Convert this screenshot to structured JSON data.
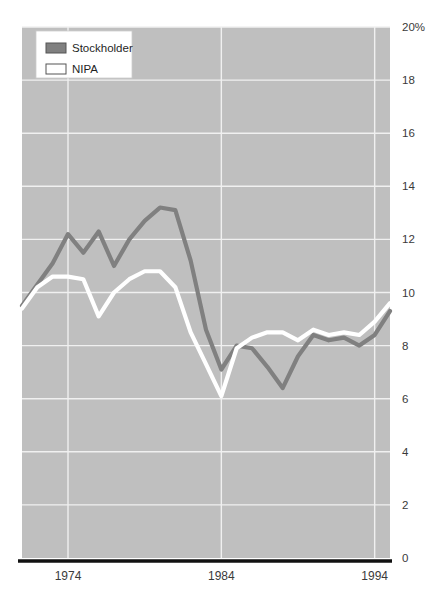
{
  "chart_data": {
    "type": "line",
    "title": "",
    "subtitle": "",
    "xlabel": "",
    "ylabel": "",
    "xlim": [
      1971,
      1995
    ],
    "ylim": [
      0,
      20
    ],
    "grid": true,
    "legend_position": "top-left",
    "y_ticks": [
      "0",
      "2",
      "4",
      "6",
      "8",
      "10",
      "12",
      "14",
      "16",
      "18",
      "20%"
    ],
    "y_tick_values": [
      0,
      2,
      4,
      6,
      8,
      10,
      12,
      14,
      16,
      18,
      20
    ],
    "x_ticks": [
      "1974",
      "1984",
      "1994"
    ],
    "x_tick_values": [
      1974,
      1984,
      1994
    ],
    "x": [
      1971,
      1972,
      1973,
      1974,
      1975,
      1976,
      1977,
      1978,
      1979,
      1980,
      1981,
      1982,
      1983,
      1984,
      1985,
      1986,
      1987,
      1988,
      1989,
      1990,
      1991,
      1992,
      1993,
      1994,
      1995
    ],
    "series": [
      {
        "name": "Stockholder",
        "color": "#808080",
        "values": [
          9.5,
          10.3,
          11.1,
          12.2,
          11.5,
          12.3,
          11.0,
          12.0,
          12.7,
          13.2,
          13.1,
          11.2,
          8.6,
          7.1,
          8.0,
          7.9,
          7.2,
          6.4,
          7.6,
          8.4,
          8.2,
          8.3,
          8.0,
          8.4,
          9.3
        ]
      },
      {
        "name": "NIPA",
        "color": "#ffffff",
        "values": [
          9.4,
          10.2,
          10.6,
          10.6,
          10.5,
          9.1,
          10.0,
          10.5,
          10.8,
          10.8,
          10.2,
          8.5,
          7.3,
          6.1,
          7.9,
          8.3,
          8.5,
          8.5,
          8.2,
          8.6,
          8.4,
          8.5,
          8.4,
          8.9,
          9.6
        ]
      }
    ]
  },
  "legend": {
    "items": [
      {
        "label": "Stockholder",
        "swatch_color": "#808080"
      },
      {
        "label": "NIPA",
        "swatch_color": "#ffffff"
      }
    ]
  },
  "colors": {
    "plot_background": "#bfbfbf",
    "gridline": "#f0f0f0",
    "axis_line": "#111111",
    "legend_background": "#ffffff",
    "legend_border": "#cccccc",
    "tick_text": "#3a3a3a",
    "stockholder_line": "#808080",
    "nipa_line": "#ffffff"
  },
  "geometry": {
    "plot_left": 22,
    "plot_right": 390,
    "plot_top": 27,
    "plot_bottom": 558
  }
}
